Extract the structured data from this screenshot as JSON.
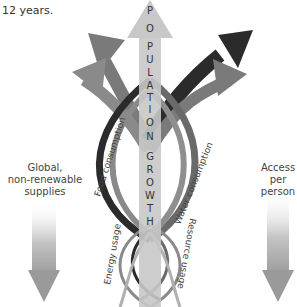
{
  "caption": "12 years.",
  "center_arrow": {
    "letters_top": [
      "P",
      "O",
      "P",
      "U",
      "L",
      "A",
      "T",
      "I",
      "O",
      "N"
    ],
    "letters_bottom": [
      "G",
      "R",
      "O",
      "W",
      "T",
      "H"
    ],
    "label": "POPULATION GROWTH",
    "color": "#c8c8c8"
  },
  "curve_labels": {
    "food": "Food consumption",
    "water": "Water consumption",
    "energy": "Energy usage",
    "resource": "Resource usage"
  },
  "left_arrow": {
    "lines": [
      "Global,",
      "non-renewable",
      "supplies"
    ]
  },
  "right_arrow": {
    "lines": [
      "Access",
      "per",
      "person"
    ]
  },
  "colors": {
    "dark": "#2b2b2b",
    "mid": "#7a7a7a",
    "light": "#a0a0a0",
    "pale": "#c8c8c8"
  }
}
